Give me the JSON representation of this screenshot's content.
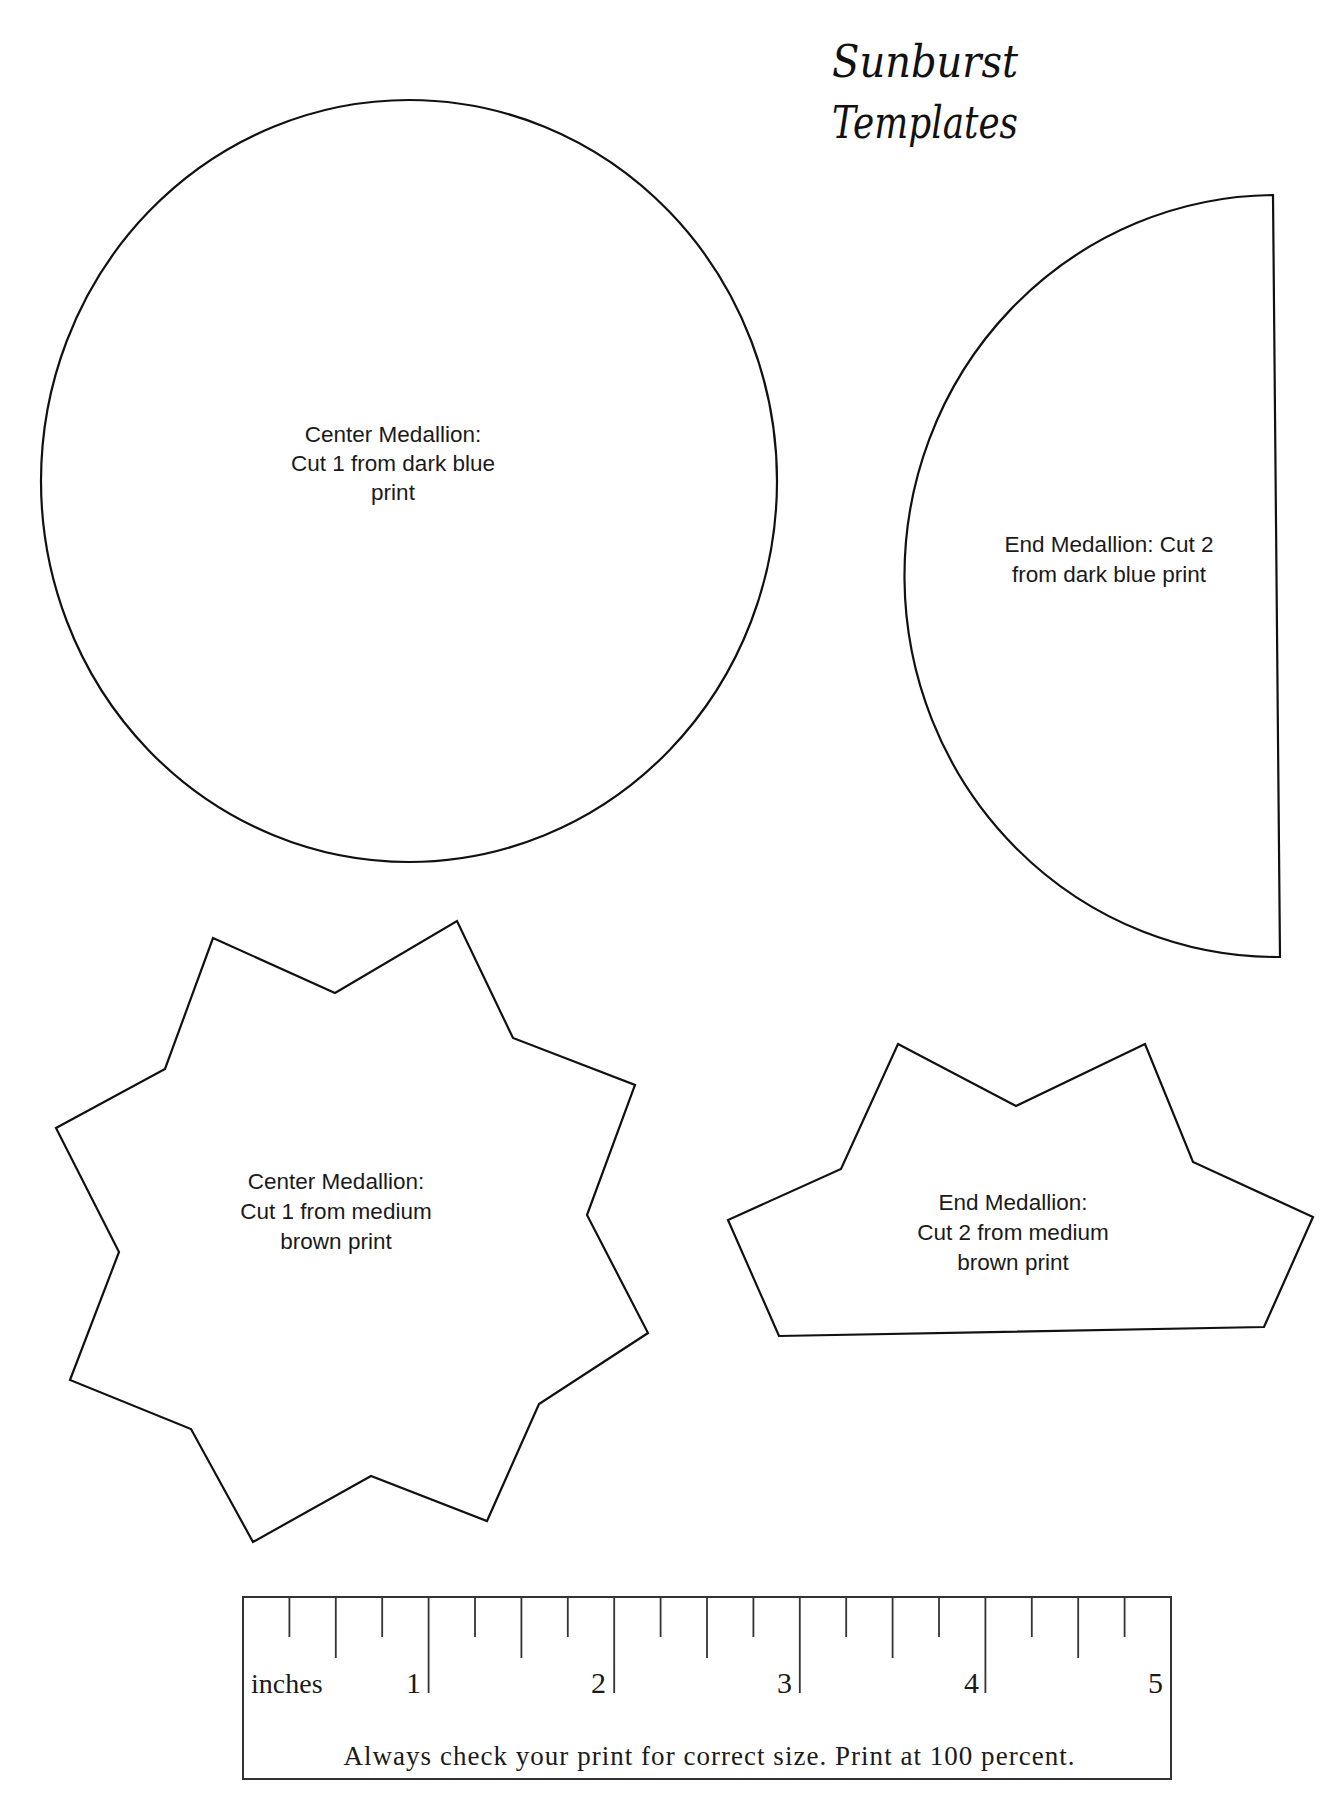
{
  "title": {
    "line1": "Sunburst",
    "line2": "Templates"
  },
  "templates": [
    {
      "id": "center-medallion-circle",
      "shape": "circle",
      "lines": [
        "Center Medallion:",
        "Cut 1 from dark blue",
        "print"
      ]
    },
    {
      "id": "end-medallion-half-circle",
      "shape": "half-circle",
      "lines": [
        "End Medallion: Cut 2",
        "from dark blue print"
      ]
    },
    {
      "id": "center-medallion-star",
      "shape": "eight-point-star",
      "lines": [
        "Center Medallion:",
        "Cut 1 from medium",
        "brown print"
      ]
    },
    {
      "id": "end-medallion-half-star",
      "shape": "half-star",
      "lines": [
        "End Medallion:",
        "Cut 2 from medium",
        "brown print"
      ]
    }
  ],
  "ruler": {
    "unit_label": "inches",
    "numbers": [
      "1",
      "2",
      "3",
      "4",
      "5"
    ],
    "ticks_per_inch": 4,
    "length_inches": 5,
    "note": "Always check your print for correct size. Print at 100 percent."
  },
  "colors": {
    "line": "#111111",
    "background": "#ffffff"
  }
}
